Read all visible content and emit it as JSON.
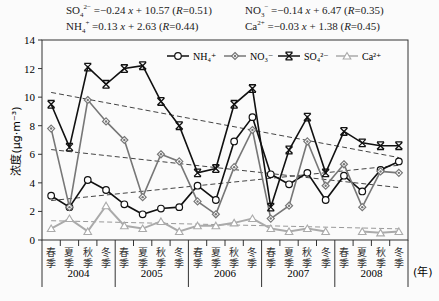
{
  "equations": [
    {
      "ion": "SO4",
      "html": "SO<sub>4</sub><sup>2−</sup> =−0.24 <i>x</i> + 10.57 (<i>R</i>=0.51)",
      "x": 66,
      "y": 3
    },
    {
      "ion": "NO3",
      "html": "NO<sub>3</sub><sup>−</sup> =−0.14 <i>x</i> + 6.47 (<i>R</i>=0.35)",
      "x": 245,
      "y": 3
    },
    {
      "ion": "NH4",
      "html": "NH<sub>4</sub><sup>+</sup> =0.13 <i>x</i> + 2.63 (<i>R</i>=0.44)",
      "x": 66,
      "y": 19
    },
    {
      "ion": "Ca",
      "html": "Ca<sup>2+</sup> =−0.03 <i>x</i> + 1.38 (<i>R</i>=0.45)",
      "x": 245,
      "y": 19
    }
  ],
  "chart_data": {
    "type": "line",
    "title": "",
    "xlabel": "(年)",
    "ylabel": "浓度(μg·m⁻³)",
    "ylim": [
      0,
      14
    ],
    "yticks": [
      0,
      2,
      4,
      6,
      8,
      10,
      12,
      14
    ],
    "grid": false,
    "legend_position": "top-right inside",
    "years": [
      "2004",
      "2005",
      "2006",
      "2007",
      "2008"
    ],
    "seasons": [
      "春季",
      "夏季",
      "秋季",
      "冬季"
    ],
    "categories": [
      "2004春季",
      "2004夏季",
      "2004秋季",
      "2004冬季",
      "2005春季",
      "2005夏季",
      "2005秋季",
      "2005冬季",
      "2006春季",
      "2006夏季",
      "2006秋季",
      "2006冬季",
      "2007春季",
      "2007夏季",
      "2007秋季",
      "2007冬季",
      "2008春季",
      "2008夏季",
      "2008秋季",
      "2008冬季"
    ],
    "series": [
      {
        "name": "NH4+",
        "label": "NH₄⁺",
        "marker": "circle",
        "color": "#111111",
        "values": [
          3.1,
          2.3,
          4.2,
          3.5,
          2.5,
          1.8,
          2.2,
          2.3,
          3.8,
          2.8,
          6.9,
          8.6,
          4.6,
          3.9,
          4.7,
          2.8,
          4.5,
          3.4,
          4.9,
          5.5
        ],
        "trend": {
          "slope": 0.13,
          "intercept": 2.63,
          "R": 0.44
        }
      },
      {
        "name": "NO3-",
        "label": "NO₃⁻",
        "marker": "diamond",
        "color": "#777777",
        "values": [
          7.8,
          2.3,
          9.8,
          8.3,
          7.0,
          3.0,
          6.0,
          5.5,
          2.7,
          1.8,
          5.1,
          7.7,
          1.5,
          2.4,
          6.9,
          3.8,
          5.3,
          2.3,
          4.8,
          4.7
        ],
        "trend": {
          "slope": -0.14,
          "intercept": 6.47,
          "R": 0.35
        }
      },
      {
        "name": "SO4 2-",
        "label": "SO₄²⁻",
        "marker": "x-star",
        "color": "#111111",
        "values": [
          9.5,
          6.5,
          12.1,
          10.9,
          12.0,
          12.2,
          9.7,
          8.0,
          4.7,
          5.0,
          9.5,
          10.6,
          2.3,
          6.3,
          8.6,
          4.7,
          7.6,
          6.8,
          6.6,
          6.6
        ],
        "trend": {
          "slope": -0.24,
          "intercept": 10.57,
          "R": 0.51
        }
      },
      {
        "name": "Ca2+",
        "label": "Ca²⁺",
        "marker": "triangle",
        "color": "#aaaaaa",
        "values": [
          0.8,
          1.5,
          0.6,
          2.4,
          1.0,
          0.8,
          1.3,
          0.6,
          1.0,
          1.0,
          1.2,
          1.5,
          0.8,
          0.6,
          0.8,
          0.6,
          null,
          0.6,
          0.5,
          0.6
        ],
        "trend": {
          "slope": -0.03,
          "intercept": 1.38,
          "R": 0.45
        }
      }
    ]
  },
  "axis": {
    "unit_label": "(年)"
  }
}
